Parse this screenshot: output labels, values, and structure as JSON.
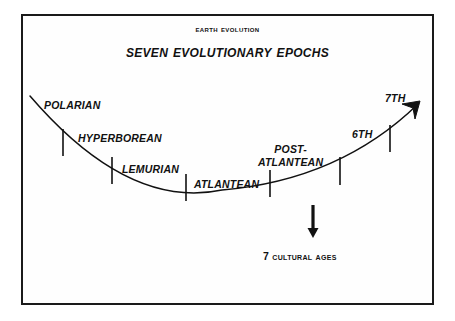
{
  "diagram": {
    "title_super": "Earth Evolution",
    "title_main": "Seven Evolutionary Epochs",
    "caption": "7 Cultural Ages",
    "colors": {
      "ink": "#111111",
      "frame": "#1a1a1a",
      "background": "#ffffff"
    },
    "epochs": [
      {
        "id": "polarian",
        "label": "POLARIAN",
        "x": 44,
        "y": 99
      },
      {
        "id": "hyperborean",
        "label": "HYPERBOREAN",
        "x": 78,
        "y": 132
      },
      {
        "id": "lemurian",
        "label": "LEMURIAN",
        "x": 122,
        "y": 163
      },
      {
        "id": "atlantean",
        "label": "ATLANTEAN",
        "x": 194,
        "y": 178
      },
      {
        "id": "post-atlantean",
        "label_line1": "POST-",
        "label_line2": "ATLANTEAN",
        "x": 258,
        "y": 143
      },
      {
        "id": "sixth",
        "label": "6TH",
        "x": 352,
        "y": 128
      },
      {
        "id": "seventh",
        "label": "7TH",
        "x": 385,
        "y": 92
      }
    ],
    "tick_marks": [
      {
        "id": "tick-polarian-hyperborean",
        "x": 63,
        "y1": 129,
        "y2": 156
      },
      {
        "id": "tick-hyperborean-lemurian",
        "x": 112,
        "y1": 157,
        "y2": 184
      },
      {
        "id": "tick-lemurian-atlantean",
        "x": 186,
        "y1": 174,
        "y2": 201
      },
      {
        "id": "tick-atlantean-postatlantean",
        "x": 270,
        "y1": 170,
        "y2": 197
      },
      {
        "id": "tick-postatlantean-sixth",
        "x": 340,
        "y1": 157,
        "y2": 185
      },
      {
        "id": "tick-sixth-seventh",
        "x": 390,
        "y1": 125,
        "y2": 152
      }
    ],
    "curve": {
      "description": "parabolic evolution curve descending then ascending",
      "path": "M 30 96 Q 128 210 222 190 Q 340 180 418 104"
    },
    "end_arrow": {
      "id": "epoch-curve-arrowhead",
      "tip_x": 420,
      "tip_y": 101
    },
    "down_arrow": {
      "id": "cultural-ages-arrow",
      "x": 313,
      "y_start": 205,
      "y_end": 238
    },
    "caption_position": {
      "x": 263,
      "y": 250
    }
  }
}
